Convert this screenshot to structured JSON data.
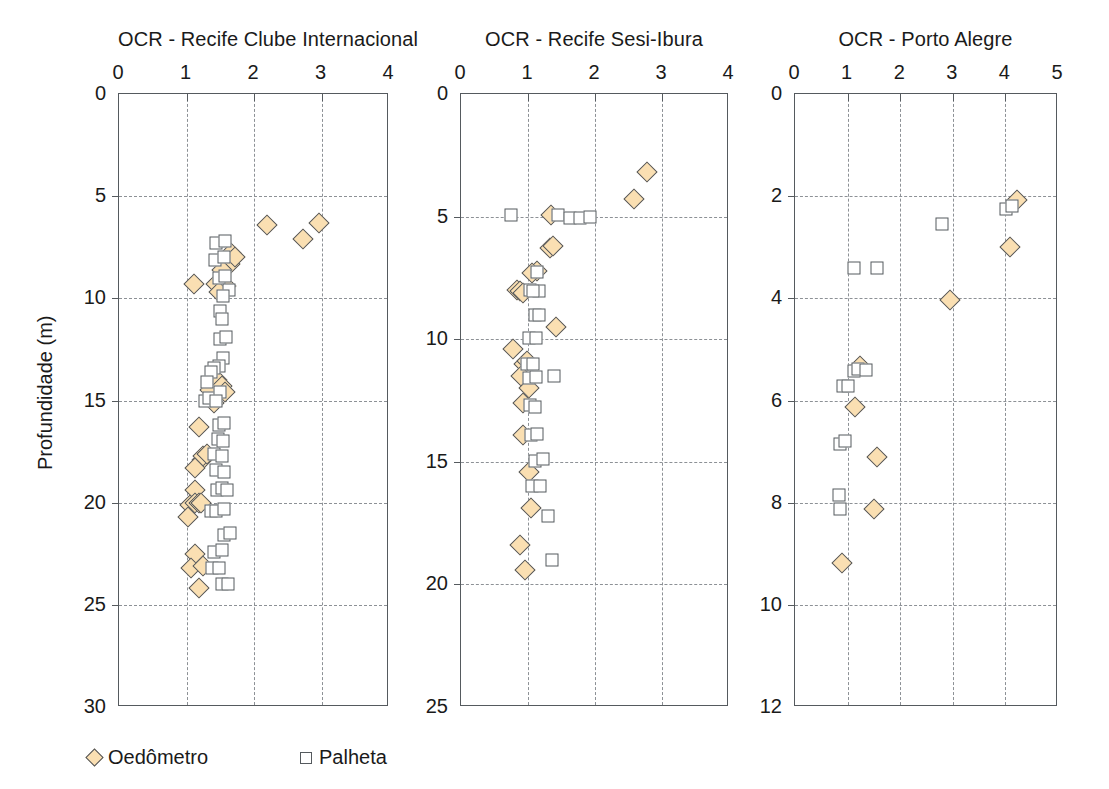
{
  "figure": {
    "ylabel": "Profundidade (m)",
    "legend": [
      {
        "label": "Oedômetro",
        "marker": "diamond",
        "fill": "#fadfb2",
        "stroke": "#4f5358"
      },
      {
        "label": "Palheta",
        "marker": "square",
        "fill": "#ffffff",
        "stroke": "#555a5e"
      }
    ]
  },
  "chart_data": [
    {
      "type": "scatter",
      "title": "OCR - Recife Clube Internacional",
      "xlabel": "OCR",
      "ylabel": "Profundidade (m)",
      "xlim": [
        0,
        4
      ],
      "ylim": [
        0,
        30
      ],
      "y_inverted": true,
      "xticks": [
        0,
        1,
        2,
        3,
        4
      ],
      "yticks": [
        0,
        5,
        10,
        15,
        20,
        25,
        30
      ],
      "grid": true,
      "series": [
        {
          "name": "Oedômetro",
          "points": [
            [
              2.19,
              6.4
            ],
            [
              2.72,
              7.1
            ],
            [
              2.96,
              6.3
            ],
            [
              1.66,
              7.8
            ],
            [
              1.64,
              8.3
            ],
            [
              1.72,
              8.0
            ],
            [
              1.53,
              8.6
            ],
            [
              1.43,
              9.3
            ],
            [
              1.59,
              9.4
            ],
            [
              1.48,
              9.7
            ],
            [
              1.11,
              9.3
            ],
            [
              1.35,
              14.5
            ],
            [
              1.45,
              14.0
            ],
            [
              1.52,
              14.3
            ],
            [
              1.41,
              15.1
            ],
            [
              1.57,
              14.6
            ],
            [
              1.18,
              16.3
            ],
            [
              1.23,
              17.9
            ],
            [
              1.25,
              17.7
            ],
            [
              1.3,
              17.6
            ],
            [
              1.13,
              18.3
            ],
            [
              1.12,
              19.4
            ],
            [
              1.05,
              20.1
            ],
            [
              1.12,
              20.0
            ],
            [
              1.18,
              20.0
            ],
            [
              1.22,
              20.0
            ],
            [
              1.02,
              20.7
            ],
            [
              1.12,
              22.5
            ],
            [
              1.07,
              23.2
            ],
            [
              1.24,
              23.1
            ],
            [
              1.19,
              24.2
            ]
          ]
        },
        {
          "name": "Palheta",
          "points": [
            [
              1.44,
              7.3
            ],
            [
              1.57,
              7.2
            ],
            [
              1.42,
              8.1
            ],
            [
              1.56,
              8.0
            ],
            [
              1.48,
              9.0
            ],
            [
              1.57,
              8.9
            ],
            [
              1.63,
              9.6
            ],
            [
              1.54,
              9.9
            ],
            [
              1.5,
              10.6
            ],
            [
              1.52,
              11.0
            ],
            [
              1.5,
              12.0
            ],
            [
              1.58,
              11.9
            ],
            [
              1.54,
              12.9
            ],
            [
              1.48,
              13.3
            ],
            [
              1.4,
              13.4
            ],
            [
              1.36,
              13.6
            ],
            [
              1.3,
              14.1
            ],
            [
              1.27,
              15.0
            ],
            [
              1.33,
              14.9
            ],
            [
              1.5,
              14.6
            ],
            [
              1.44,
              15.0
            ],
            [
              1.48,
              16.2
            ],
            [
              1.56,
              16.1
            ],
            [
              1.46,
              16.9
            ],
            [
              1.54,
              17.0
            ],
            [
              1.4,
              17.6
            ],
            [
              1.52,
              17.7
            ],
            [
              1.43,
              18.4
            ],
            [
              1.55,
              18.5
            ],
            [
              1.45,
              19.4
            ],
            [
              1.53,
              19.3
            ],
            [
              1.6,
              19.4
            ],
            [
              1.36,
              20.4
            ],
            [
              1.44,
              20.4
            ],
            [
              1.56,
              20.3
            ],
            [
              1.55,
              21.6
            ],
            [
              1.65,
              21.5
            ],
            [
              1.4,
              22.4
            ],
            [
              1.52,
              22.3
            ],
            [
              1.38,
              23.2
            ],
            [
              1.48,
              23.2
            ],
            [
              1.52,
              24.0
            ],
            [
              1.62,
              24.0
            ]
          ]
        }
      ]
    },
    {
      "type": "scatter",
      "title": "OCR - Recife Sesi-Ibura",
      "xlabel": "OCR",
      "ylabel": "Profundidade (m)",
      "xlim": [
        0,
        4
      ],
      "ylim": [
        0,
        25
      ],
      "y_inverted": true,
      "xticks": [
        0,
        1,
        2,
        3,
        4
      ],
      "yticks": [
        0,
        5,
        10,
        15,
        20,
        25
      ],
      "grid": true,
      "series": [
        {
          "name": "Oedômetro",
          "points": [
            [
              2.78,
              3.2
            ],
            [
              2.58,
              4.3
            ],
            [
              1.34,
              4.95
            ],
            [
              1.33,
              6.3
            ],
            [
              1.38,
              6.2
            ],
            [
              1.13,
              7.2
            ],
            [
              1.06,
              7.3
            ],
            [
              0.84,
              8.0
            ],
            [
              0.88,
              8.05
            ],
            [
              0.93,
              8.1
            ],
            [
              1.42,
              9.5
            ],
            [
              0.78,
              10.4
            ],
            [
              0.94,
              11.0
            ],
            [
              0.98,
              10.9
            ],
            [
              0.9,
              11.5
            ],
            [
              1.02,
              12.0
            ],
            [
              0.93,
              12.6
            ],
            [
              0.92,
              13.9
            ],
            [
              1.02,
              15.4
            ],
            [
              1.04,
              16.9
            ],
            [
              0.88,
              18.4
            ],
            [
              0.96,
              19.4
            ]
          ]
        },
        {
          "name": "Palheta",
          "points": [
            [
              0.74,
              4.95
            ],
            [
              1.45,
              4.95
            ],
            [
              1.63,
              5.05
            ],
            [
              1.78,
              5.05
            ],
            [
              1.93,
              5.0
            ],
            [
              1.14,
              7.25
            ],
            [
              1.16,
              8.05
            ],
            [
              1.03,
              8.0
            ],
            [
              1.08,
              8.05
            ],
            [
              1.1,
              9.0
            ],
            [
              1.16,
              9.0
            ],
            [
              1.02,
              9.95
            ],
            [
              1.12,
              9.95
            ],
            [
              0.98,
              11.0
            ],
            [
              1.08,
              11.0
            ],
            [
              1.02,
              11.6
            ],
            [
              1.12,
              11.55
            ],
            [
              1.39,
              11.5
            ],
            [
              1.03,
              12.7
            ],
            [
              1.1,
              12.75
            ],
            [
              1.04,
              13.9
            ],
            [
              1.14,
              13.85
            ],
            [
              1.1,
              14.95
            ],
            [
              1.22,
              14.9
            ],
            [
              1.06,
              16.0
            ],
            [
              1.18,
              16.0
            ],
            [
              1.3,
              17.2
            ],
            [
              1.36,
              19.0
            ]
          ]
        }
      ]
    },
    {
      "type": "scatter",
      "title": "OCR - Porto Alegre",
      "xlabel": "OCR",
      "ylabel": "Profundidade (m)",
      "xlim": [
        0,
        5
      ],
      "ylim": [
        0,
        12
      ],
      "y_inverted": true,
      "xticks": [
        0,
        1,
        2,
        3,
        4,
        5
      ],
      "yticks": [
        0,
        2,
        4,
        6,
        8,
        10,
        12
      ],
      "grid": true,
      "series": [
        {
          "name": "Oedômetro",
          "points": [
            [
              4.22,
              2.08
            ],
            [
              4.08,
              3.0
            ],
            [
              2.95,
              4.03
            ],
            [
              1.23,
              5.32
            ],
            [
              1.15,
              6.13
            ],
            [
              1.56,
              7.1
            ],
            [
              1.5,
              8.12
            ],
            [
              0.9,
              9.18
            ]
          ]
        },
        {
          "name": "Palheta",
          "points": [
            [
              4.02,
              2.25
            ],
            [
              4.13,
              2.2
            ],
            [
              2.8,
              2.55
            ],
            [
              1.55,
              3.4
            ],
            [
              1.12,
              3.4
            ],
            [
              1.13,
              5.43
            ],
            [
              1.2,
              5.38
            ],
            [
              1.35,
              5.4
            ],
            [
              0.92,
              5.72
            ],
            [
              1.0,
              5.72
            ],
            [
              0.86,
              6.85
            ],
            [
              0.95,
              6.8
            ],
            [
              0.84,
              7.85
            ],
            [
              0.86,
              8.12
            ]
          ]
        }
      ]
    }
  ]
}
